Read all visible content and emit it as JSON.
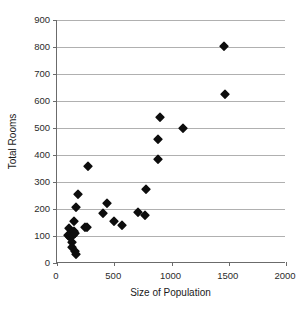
{
  "chart_data": {
    "type": "scatter",
    "title": "",
    "xlabel": "Size of Population",
    "ylabel": "Total Rooms",
    "xlim": [
      0,
      2000
    ],
    "ylim": [
      0,
      900
    ],
    "xticks": [
      0,
      500,
      1000,
      1500,
      2000
    ],
    "yticks": [
      0,
      100,
      200,
      300,
      400,
      500,
      600,
      700,
      800,
      900
    ],
    "grid": "horizontal",
    "legend": "none",
    "marker": "filled-diamond",
    "marker_color": "#0d0d0d",
    "points": [
      {
        "x": 100,
        "y": 103
      },
      {
        "x": 105,
        "y": 128
      },
      {
        "x": 115,
        "y": 98
      },
      {
        "x": 120,
        "y": 112
      },
      {
        "x": 130,
        "y": 78
      },
      {
        "x": 135,
        "y": 60
      },
      {
        "x": 140,
        "y": 105
      },
      {
        "x": 145,
        "y": 120
      },
      {
        "x": 150,
        "y": 155
      },
      {
        "x": 155,
        "y": 45
      },
      {
        "x": 160,
        "y": 112
      },
      {
        "x": 165,
        "y": 33
      },
      {
        "x": 170,
        "y": 207
      },
      {
        "x": 185,
        "y": 255
      },
      {
        "x": 245,
        "y": 133
      },
      {
        "x": 265,
        "y": 134
      },
      {
        "x": 270,
        "y": 360
      },
      {
        "x": 400,
        "y": 186
      },
      {
        "x": 440,
        "y": 222
      },
      {
        "x": 495,
        "y": 154
      },
      {
        "x": 570,
        "y": 142
      },
      {
        "x": 710,
        "y": 189
      },
      {
        "x": 765,
        "y": 178
      },
      {
        "x": 780,
        "y": 275
      },
      {
        "x": 880,
        "y": 384
      },
      {
        "x": 885,
        "y": 459
      },
      {
        "x": 900,
        "y": 540
      },
      {
        "x": 1100,
        "y": 500
      },
      {
        "x": 1460,
        "y": 805
      },
      {
        "x": 1470,
        "y": 625
      }
    ]
  }
}
